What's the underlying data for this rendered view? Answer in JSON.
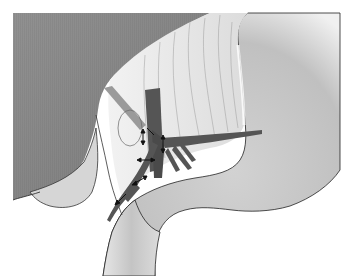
{
  "figure": {
    "type": "anatomical-illustration",
    "style": "grayscale medical drawing",
    "structures": [
      {
        "name": "liver",
        "description": "large dark-gray organ at upper left"
      },
      {
        "name": "gallbladder-lobe",
        "description": "rounded lower-left lobe edge"
      },
      {
        "name": "hepatoduodenal-ligament",
        "description": "light striated tissue at center top"
      },
      {
        "name": "stomach",
        "description": "light-gray organ at right"
      },
      {
        "name": "duodenum",
        "description": "curved tube at bottom center"
      },
      {
        "name": "vessels",
        "description": "dark branching vessels at center"
      },
      {
        "name": "arrows",
        "description": "small double-headed arrows along vessels"
      }
    ],
    "colors": {
      "liver": "#8a8a8a",
      "liver_edge": "#6e6e6e",
      "ligament": "#e4e4e4",
      "stomach": "#bdbdbd",
      "stomach_light": "#e8e8e8",
      "vessel": "#555555",
      "outline": "#222222",
      "background": "#ffffff"
    }
  }
}
